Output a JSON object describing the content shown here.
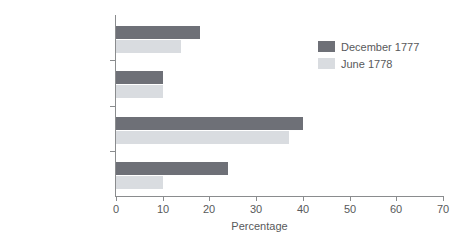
{
  "chart_data": {
    "type": "bar",
    "orientation": "horizontal",
    "title": "",
    "xlabel": "Percentage",
    "ylabel": "",
    "xlim": [
      0,
      70
    ],
    "xticks": [
      0,
      10,
      20,
      30,
      40,
      50,
      60,
      70
    ],
    "grid": false,
    "legend_position": "upper right",
    "categories": [
      "Silks",
      "Linens",
      "Cottons and checks",
      "Cottons"
    ],
    "series": [
      {
        "name": "December 1777",
        "color": "#6e7077",
        "values": [
          18,
          10,
          40,
          24
        ]
      },
      {
        "name": "June 1778",
        "color": "#d9dce0",
        "values": [
          14,
          10,
          37,
          10
        ]
      }
    ]
  },
  "colors": {
    "series_december_1777": "#6e7077",
    "series_june_1778": "#d9dce0",
    "axis": "#8a8c8e",
    "text": "#58595b",
    "background": "#ffffff"
  }
}
